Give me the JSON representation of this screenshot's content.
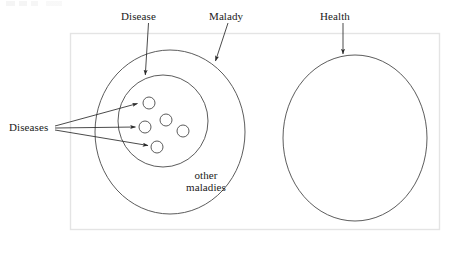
{
  "figure": {
    "type": "venn-style set diagram",
    "background_color": "#ffffff",
    "stroke_color": "#3a3a3a",
    "frame_color": "#e3e3e3",
    "text_color": "#1a1a1a"
  },
  "labels": {
    "disease": "Disease",
    "malady": "Malady",
    "health": "Health",
    "diseases": "Diseases",
    "other_maladies_line1": "other",
    "other_maladies_line2": "maladies"
  },
  "regions": {
    "frame": {
      "name": "outer-frame-rectangle",
      "x": 70,
      "y": 33,
      "width": 370,
      "height": 197
    },
    "malady_circle": {
      "name": "malady-circle",
      "cx": 170,
      "cy": 132,
      "rx": 75,
      "ry": 82
    },
    "disease_circle": {
      "name": "disease-circle",
      "cx": 163,
      "cy": 121,
      "rx": 45,
      "ry": 46
    },
    "health_circle": {
      "name": "health-circle",
      "cx": 355,
      "cy": 138,
      "rx": 72,
      "ry": 83
    }
  },
  "disease_dots": [
    {
      "id": "disease-dot-1",
      "cx": 149,
      "cy": 103,
      "r": 6
    },
    {
      "id": "disease-dot-2",
      "cx": 166,
      "cy": 120,
      "r": 6
    },
    {
      "id": "disease-dot-3",
      "cx": 145,
      "cy": 127,
      "r": 6
    },
    {
      "id": "disease-dot-4",
      "cx": 183,
      "cy": 131,
      "r": 6
    },
    {
      "id": "disease-dot-5",
      "cx": 157,
      "cy": 147,
      "r": 6
    }
  ],
  "arrows": [
    {
      "id": "disease-arrow",
      "from": [
        148,
        23
      ],
      "to": [
        145,
        76
      ],
      "label": "Disease"
    },
    {
      "id": "malady-arrow",
      "from": [
        228,
        23
      ],
      "to": [
        215,
        62
      ],
      "label": "Malady"
    },
    {
      "id": "health-arrow",
      "from": [
        343,
        23
      ],
      "to": [
        343,
        55
      ],
      "label": "Health"
    },
    {
      "id": "diseases-arrow-1",
      "from": [
        55,
        126
      ],
      "to": [
        138,
        103
      ],
      "label": "Diseases"
    },
    {
      "id": "diseases-arrow-2",
      "from": [
        55,
        128
      ],
      "to": [
        136,
        127
      ],
      "label": "Diseases"
    },
    {
      "id": "diseases-arrow-3",
      "from": [
        55,
        130
      ],
      "to": [
        149,
        146
      ],
      "label": "Diseases"
    }
  ]
}
